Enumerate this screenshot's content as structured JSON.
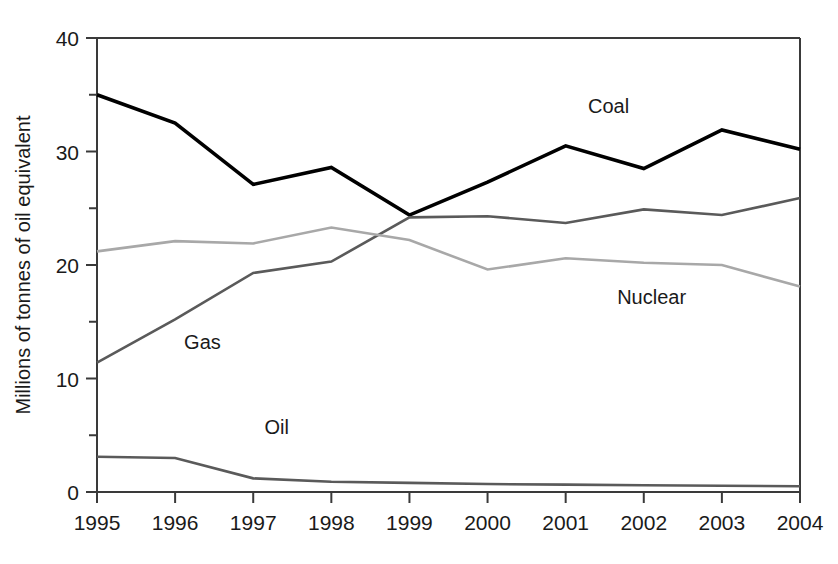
{
  "chart_data": {
    "type": "line",
    "title": "",
    "xlabel": "",
    "ylabel": "Millions of tonnes of oil equivalent",
    "x": [
      1995,
      1996,
      1997,
      1998,
      1999,
      2000,
      2001,
      2002,
      2003,
      2004
    ],
    "categories": [
      "1995",
      "1996",
      "1997",
      "1998",
      "1999",
      "2000",
      "2001",
      "2002",
      "2003",
      "2004"
    ],
    "xlim": [
      1995,
      2004
    ],
    "ylim": [
      0,
      40
    ],
    "y_major_ticks": [
      0,
      10,
      20,
      30,
      40
    ],
    "y_major_tick_labels": [
      "0",
      "10",
      "20",
      "30",
      "40"
    ],
    "y_minor_ticks": [
      5,
      15,
      25,
      35
    ],
    "grid": false,
    "legend": "inline-labels",
    "series": [
      {
        "name": "Coal",
        "color": "#000000",
        "width": 3.6,
        "values": [
          35.0,
          32.5,
          27.1,
          28.6,
          24.4,
          27.3,
          30.5,
          28.5,
          31.9,
          30.2
        ],
        "label_x": 2001.55,
        "label_y": 33.4
      },
      {
        "name": "Gas",
        "color": "#5a5a5a",
        "width": 2.6,
        "values": [
          11.4,
          15.2,
          19.3,
          20.3,
          24.2,
          24.3,
          23.7,
          24.9,
          24.4,
          25.9
        ],
        "label_x": 1996.35,
        "label_y": 12.6
      },
      {
        "name": "Nuclear",
        "color": "#a8a8a8",
        "width": 2.6,
        "values": [
          21.2,
          22.1,
          21.9,
          23.3,
          22.2,
          19.6,
          20.6,
          20.2,
          20.0,
          18.1
        ],
        "label_x": 2002.1,
        "label_y": 16.6
      },
      {
        "name": "Oil",
        "color": "#5a5a5a",
        "width": 2.6,
        "values": [
          3.1,
          3.0,
          1.2,
          0.9,
          0.8,
          0.7,
          0.65,
          0.6,
          0.55,
          0.5
        ],
        "label_x": 1997.3,
        "label_y": 5.1
      }
    ]
  },
  "axis": {
    "y_title": "Millions of tonnes of oil equivalent"
  }
}
